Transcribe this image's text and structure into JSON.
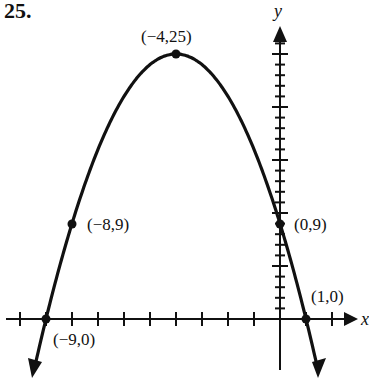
{
  "problem_number": "25.",
  "chart_data": {
    "type": "line",
    "title": "",
    "xlabel": "x",
    "ylabel": "y",
    "xlim": [
      -10,
      2
    ],
    "ylim": [
      0,
      25
    ],
    "grid": false,
    "x_ticks": [
      -10,
      -9,
      -8,
      -7,
      -6,
      -5,
      -4,
      -3,
      -2,
      -1,
      1,
      2
    ],
    "y_ticks_minor_step": 1,
    "y_ticks_major_step": 5,
    "labeled_points": [
      {
        "x": -4,
        "y": 25,
        "label": "(−4,25)"
      },
      {
        "x": -8,
        "y": 9,
        "label": "(−8,9)"
      },
      {
        "x": 0,
        "y": 9,
        "label": "(0,9)"
      },
      {
        "x": -9,
        "y": 0,
        "label": "(−9,0)"
      },
      {
        "x": 1,
        "y": 0,
        "label": "(1,0)"
      }
    ],
    "series": [
      {
        "name": "parabola",
        "equation": "y = -(x+4)^2 + 25",
        "x": [
          -9.5,
          -9,
          -8,
          -7,
          -6,
          -5,
          -4,
          -3,
          -2,
          -1,
          0,
          1,
          1.5
        ],
        "y": [
          -5.25,
          0,
          9,
          16,
          21,
          24,
          25,
          24,
          21,
          16,
          9,
          0,
          -5.25
        ]
      }
    ]
  },
  "labels": {
    "vertex": "(−4,25)",
    "p_left": "(−8,9)",
    "p_right": "(0,9)",
    "root_left": "(−9,0)",
    "root_right": "(1,0)",
    "x_axis": "x",
    "y_axis": "y"
  }
}
